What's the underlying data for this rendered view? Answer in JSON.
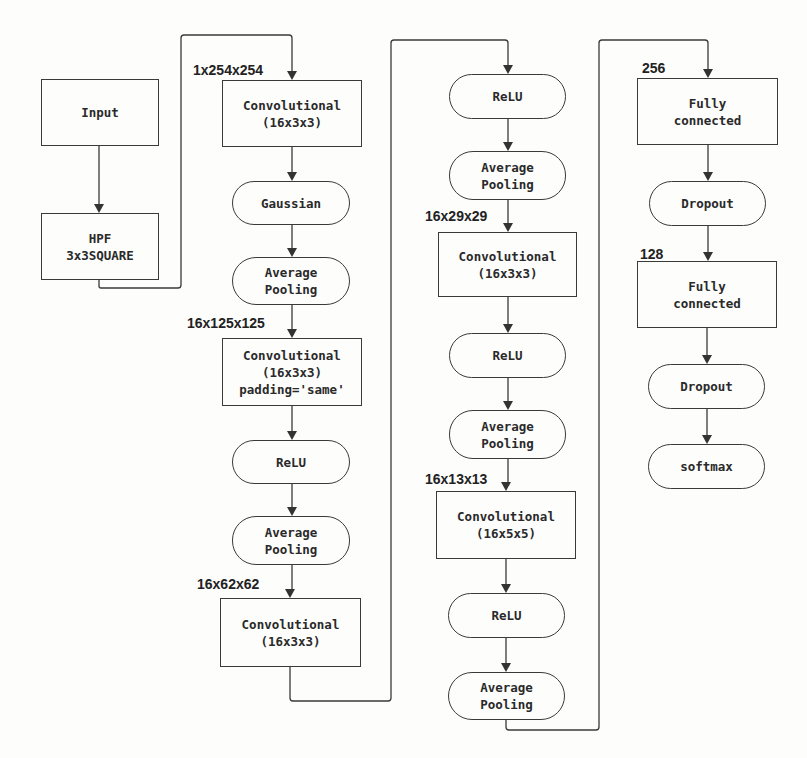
{
  "diagram": {
    "type": "cnn-architecture-flowchart",
    "columns": [
      {
        "id": "col1",
        "nodes": [
          {
            "label": "Input",
            "shape": "rect"
          },
          {
            "label": "HPF\n3x3SQUARE",
            "shape": "rect"
          }
        ]
      },
      {
        "id": "col2",
        "nodes": [
          {
            "label": "Convolutional\n(16x3x3)",
            "shape": "rect",
            "input_dim": "1x254x254"
          },
          {
            "label": "Gaussian",
            "shape": "pill"
          },
          {
            "label": "Average\nPooling",
            "shape": "pill"
          },
          {
            "label": "Convolutional\n(16x3x3)\npadding='same'",
            "shape": "rect",
            "input_dim": "16x125x125"
          },
          {
            "label": "ReLU",
            "shape": "pill"
          },
          {
            "label": "Average\nPooling",
            "shape": "pill"
          },
          {
            "label": "Convolutional\n(16x3x3)",
            "shape": "rect",
            "input_dim": "16x62x62"
          }
        ]
      },
      {
        "id": "col3",
        "nodes": [
          {
            "label": "ReLU",
            "shape": "pill"
          },
          {
            "label": "Average\nPooling",
            "shape": "pill"
          },
          {
            "label": "Convolutional\n(16x3x3)",
            "shape": "rect",
            "input_dim": "16x29x29"
          },
          {
            "label": "ReLU",
            "shape": "pill"
          },
          {
            "label": "Average\nPooling",
            "shape": "pill"
          },
          {
            "label": "Convolutional\n(16x5x5)",
            "shape": "rect",
            "input_dim": "16x13x13"
          },
          {
            "label": "ReLU",
            "shape": "pill"
          },
          {
            "label": "Average\nPooling",
            "shape": "pill"
          }
        ]
      },
      {
        "id": "col4",
        "nodes": [
          {
            "label": "Fully\nconnected",
            "shape": "rect",
            "input_dim": "256"
          },
          {
            "label": "Dropout",
            "shape": "pill"
          },
          {
            "label": "Fully\nconnected",
            "shape": "rect",
            "input_dim": "128"
          },
          {
            "label": "Dropout",
            "shape": "pill"
          },
          {
            "label": "softmax",
            "shape": "pill"
          }
        ]
      }
    ],
    "colors": {
      "stroke": "#3a3a3a",
      "text": "#2a2a2a",
      "background": "#fdfdfc"
    }
  }
}
